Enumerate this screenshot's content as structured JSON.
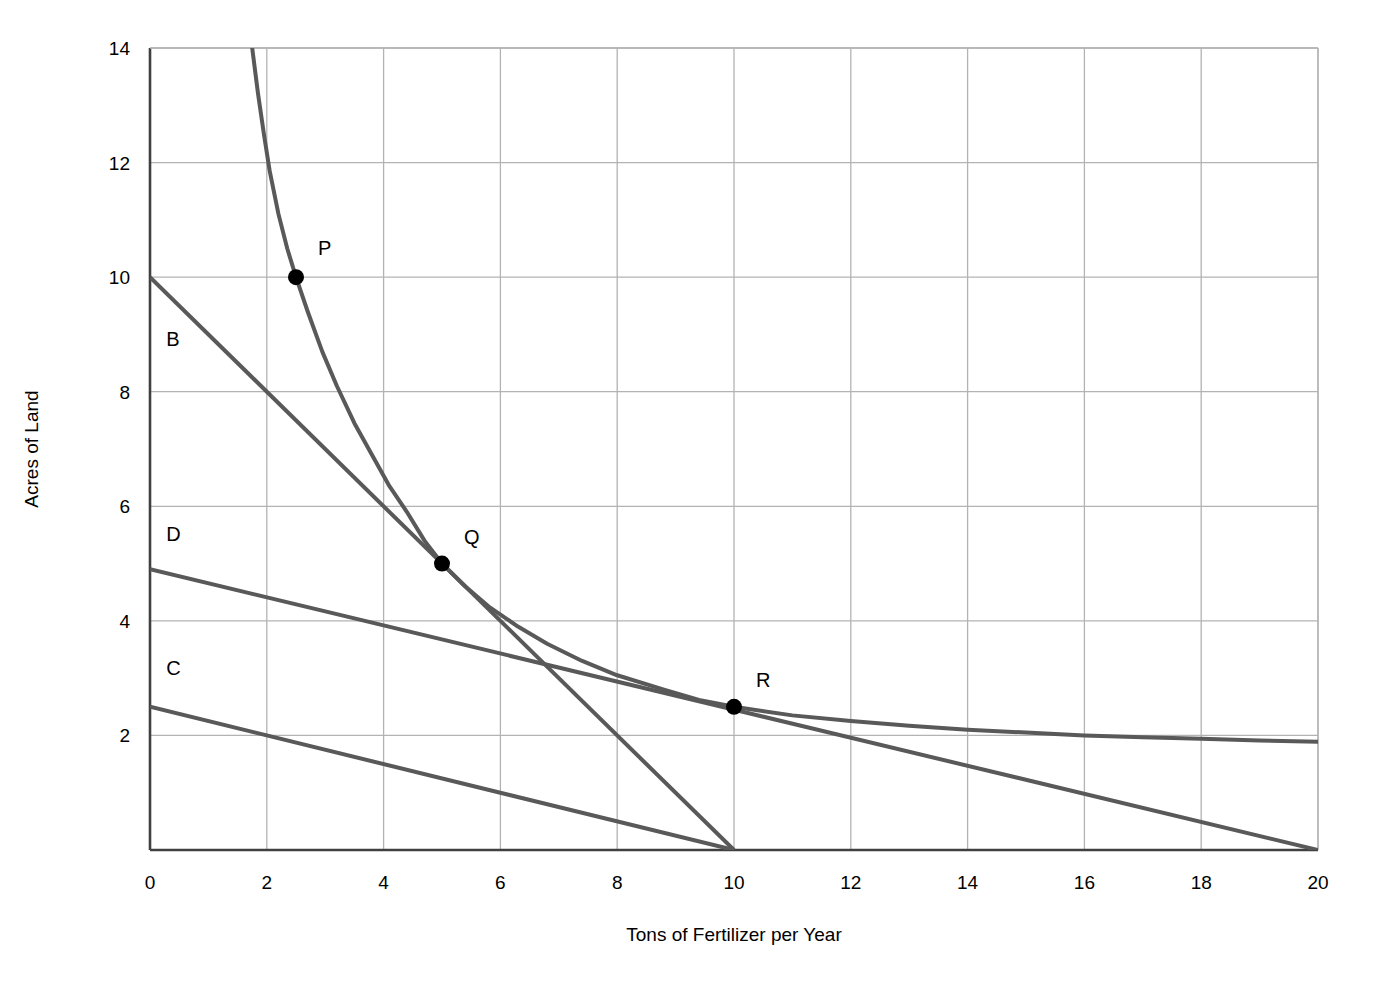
{
  "chart_data": {
    "type": "line",
    "title": "",
    "xlabel": "Tons of Fertilizer per Year",
    "ylabel": "Acres of Land",
    "xlim": [
      0,
      20
    ],
    "ylim": [
      0,
      14
    ],
    "xticks": [
      0,
      2,
      4,
      6,
      8,
      10,
      12,
      14,
      16,
      18,
      20
    ],
    "yticks": [
      2,
      4,
      6,
      8,
      10,
      12,
      14
    ],
    "xtick_labels": [
      "0",
      "2",
      "4",
      "6",
      "8",
      "10",
      "12",
      "14",
      "16",
      "18",
      "20"
    ],
    "ytick_labels": [
      "2",
      "4",
      "6",
      "8",
      "10",
      "12",
      "14"
    ],
    "grid": true,
    "legend": "none",
    "series": [
      {
        "name": "isoquant",
        "label": "",
        "kind": "curve",
        "color": "#595959",
        "width": 4,
        "points": [
          [
            1.75,
            14.0
          ],
          [
            1.85,
            13.2
          ],
          [
            1.95,
            12.5
          ],
          [
            2.05,
            11.85
          ],
          [
            2.2,
            11.1
          ],
          [
            2.35,
            10.5
          ],
          [
            2.5,
            10.0
          ],
          [
            2.7,
            9.4
          ],
          [
            2.95,
            8.7
          ],
          [
            3.2,
            8.1
          ],
          [
            3.5,
            7.45
          ],
          [
            3.8,
            6.9
          ],
          [
            4.1,
            6.35
          ],
          [
            4.4,
            5.9
          ],
          [
            4.7,
            5.4
          ],
          [
            5.0,
            5.0
          ],
          [
            5.4,
            4.6
          ],
          [
            5.8,
            4.25
          ],
          [
            6.3,
            3.9
          ],
          [
            6.8,
            3.6
          ],
          [
            7.4,
            3.3
          ],
          [
            8.0,
            3.05
          ],
          [
            8.8,
            2.8
          ],
          [
            9.4,
            2.62
          ],
          [
            10.0,
            2.5
          ],
          [
            11.0,
            2.35
          ],
          [
            12.0,
            2.25
          ],
          [
            13.0,
            2.17
          ],
          [
            14.0,
            2.1
          ],
          [
            15.0,
            2.05
          ],
          [
            16.0,
            2.0
          ],
          [
            17.0,
            1.97
          ],
          [
            18.0,
            1.94
          ],
          [
            19.0,
            1.91
          ],
          [
            20.0,
            1.89
          ]
        ]
      },
      {
        "name": "line-B",
        "label": "B",
        "kind": "line",
        "color": "#595959",
        "width": 4,
        "from": [
          0,
          10
        ],
        "to": [
          10,
          0
        ],
        "label_pos": [
          0.28,
          8.8
        ]
      },
      {
        "name": "line-D",
        "label": "D",
        "kind": "line",
        "color": "#595959",
        "width": 4,
        "from": [
          0,
          4.9
        ],
        "to": [
          20,
          0
        ],
        "label_pos": [
          0.28,
          5.4
        ]
      },
      {
        "name": "line-C",
        "label": "C",
        "kind": "line",
        "color": "#595959",
        "width": 4,
        "from": [
          0,
          2.5
        ],
        "to": [
          10,
          0
        ],
        "label_pos": [
          0.28,
          3.05
        ]
      }
    ],
    "points": [
      {
        "name": "P",
        "x": 2.5,
        "y": 10.0,
        "label": "P",
        "label_dx": 22,
        "label_dy": -22
      },
      {
        "name": "Q",
        "x": 5.0,
        "y": 5.0,
        "label": "Q",
        "label_dx": 22,
        "label_dy": -20
      },
      {
        "name": "R",
        "x": 10.0,
        "y": 2.5,
        "label": "R",
        "label_dx": 22,
        "label_dy": -20
      }
    ],
    "annotations": []
  },
  "style": {
    "axis_color": "#404040",
    "grid_color": "#b3b3b3",
    "minor_grid_color": "#d9d9d9",
    "curve_color": "#595959",
    "point_color": "#000000",
    "background": "#ffffff"
  }
}
